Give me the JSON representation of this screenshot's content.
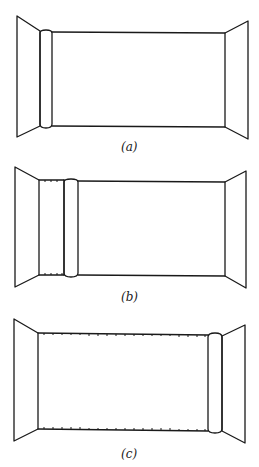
{
  "figure": {
    "panels": [
      {
        "id": "a",
        "label": "(a)",
        "description": "Empty room with rolled-up wallpaper roll at left edge of back wall"
      },
      {
        "id": "b",
        "label": "(b)",
        "description": "Wallpaper partially unrolled from left, roll moving right"
      },
      {
        "id": "c",
        "label": "(c)",
        "description": "Wallpaper fully applied across back wall, roll at right edge"
      }
    ],
    "colors": {
      "stroke": "#1a1a1a",
      "background": "#ffffff"
    }
  }
}
